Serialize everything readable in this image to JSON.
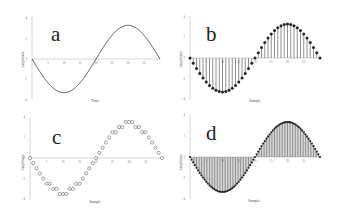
{
  "chart_data": [
    {
      "panel": "a",
      "type": "line",
      "title": "",
      "xlabel": "Time",
      "ylabel": "Amplitude",
      "xticks": [
        "0",
        "5",
        "10",
        "15",
        "20",
        "25",
        "30",
        "35"
      ],
      "yticks": [
        "4",
        "2",
        "0",
        "-2",
        "-4"
      ],
      "ylim": [
        -4,
        4
      ],
      "xlim": [
        0,
        40
      ],
      "series": [
        {
          "name": "continuous sine",
          "function": "-3.3*sin(2*pi*t/40)",
          "samples": 200
        }
      ],
      "grid": false,
      "legend": "none"
    },
    {
      "panel": "b",
      "type": "stem",
      "xlabel": "Sample",
      "ylabel": "Amplitude",
      "xticks": [
        "0",
        "5",
        "10",
        "15",
        "20",
        "25",
        "30",
        "35"
      ],
      "yticks": [
        "4",
        "2",
        "0",
        "-2",
        "-4"
      ],
      "ylim": [
        -4,
        4
      ],
      "xlim": [
        0,
        40
      ],
      "series": [
        {
          "name": "sampled sine",
          "function": "-3.3*sin(2*pi*n/40)",
          "n_points": 41,
          "marker": "filled-circle"
        }
      ],
      "grid": false,
      "legend": "none"
    },
    {
      "panel": "c",
      "type": "scatter",
      "xlabel": "Sample",
      "ylabel": "Amplitude",
      "xticks": [
        "0",
        "5",
        "10",
        "15",
        "20",
        "25",
        "30",
        "35"
      ],
      "yticks": [
        "4",
        "2",
        "0",
        "-2",
        "-4"
      ],
      "ylim": [
        -4,
        4
      ],
      "xlim": [
        0,
        40
      ],
      "series": [
        {
          "name": "quantized samples",
          "function": "round(-3.3*sin(2*pi*n/40)*2)/2",
          "n_points": 41,
          "marker": "open-circle"
        }
      ],
      "grid": false,
      "legend": "none"
    },
    {
      "panel": "d",
      "type": "stem",
      "xlabel": "Sample",
      "ylabel": "Amplitude",
      "xticks": [
        "0",
        "5",
        "10",
        "15",
        "20",
        "25",
        "30",
        "35"
      ],
      "yticks": [
        "4",
        "2",
        "0",
        "-2",
        "-4"
      ],
      "ylim": [
        -4,
        4
      ],
      "xlim": [
        0,
        40
      ],
      "series": [
        {
          "name": "densely sampled sine",
          "function": "-3.3*sin(2*pi*n/80)",
          "n_points": 81,
          "marker": "filled-circle"
        }
      ],
      "grid": false,
      "legend": "none"
    }
  ],
  "panels": [
    {
      "letter": "a",
      "xlabel": "Time",
      "ylabel": "Amplitude"
    },
    {
      "letter": "b",
      "xlabel": "Sample",
      "ylabel": "Amplitude"
    },
    {
      "letter": "c",
      "xlabel": "Sample",
      "ylabel": "Amplitude"
    },
    {
      "letter": "d",
      "xlabel": "Sample",
      "ylabel": "Amplitude"
    }
  ]
}
